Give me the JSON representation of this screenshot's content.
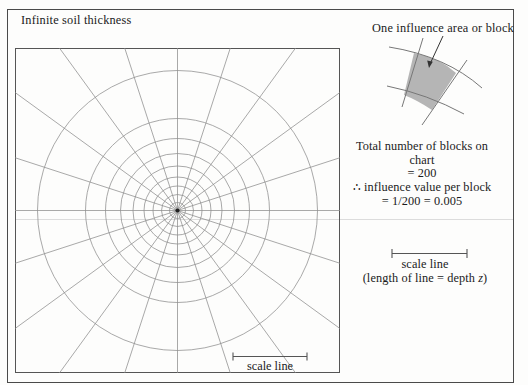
{
  "figure": {
    "title": "Infinite soil thickness",
    "chart": {
      "type": "newmark-influence-chart",
      "scale_line_label": "scale line",
      "num_radial_lines": 20,
      "circle_radii": [
        8,
        16,
        24.5,
        33.5,
        44.5,
        57,
        72,
        92,
        140
      ]
    },
    "legend": {
      "block_label": "One influence area or block",
      "total_line1": "Total number of blocks on chart",
      "total_line2": "= 200",
      "influence_line1": "∴ influence value per block",
      "influence_line2": "= 1/200 = 0.005",
      "scale_line_label": "scale line",
      "scale_note_prefix": "(length of line = depth ",
      "scale_note_var": "z",
      "scale_note_suffix": ")"
    },
    "colors": {
      "block_fill": "#b5b5b5",
      "grid_line": "#8c8c8c",
      "border": "#4a4a4a",
      "text": "#1b1b1b"
    }
  }
}
